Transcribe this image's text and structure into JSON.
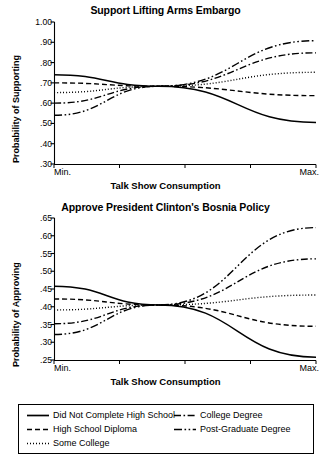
{
  "chart_data": [
    {
      "type": "line",
      "title": "Support Lifting Arms Embargo",
      "xlabel": "Talk Show Consumption",
      "ylabel": "Probability of Supporting",
      "xtick_labels": [
        "Min.",
        "Max."
      ],
      "ytick_labels": [
        "1.00",
        ".90",
        ".80",
        ".70",
        ".60",
        ".50",
        ".40",
        ".30"
      ],
      "ytick_values": [
        1.0,
        0.9,
        0.8,
        0.7,
        0.6,
        0.5,
        0.4,
        0.3
      ],
      "ylim": [
        0.3,
        1.0
      ],
      "xlim": [
        0,
        1
      ],
      "grid": false,
      "legend_position": "below-figure",
      "series": [
        {
          "name": "Did Not Complete High School",
          "style": "solid",
          "x": [
            0,
            0.4,
            1
          ],
          "values": [
            0.74,
            0.683,
            0.505
          ]
        },
        {
          "name": "High School Diploma",
          "style": "dashed",
          "x": [
            0,
            0.4,
            1
          ],
          "values": [
            0.7,
            0.683,
            0.637
          ]
        },
        {
          "name": "Some College",
          "style": "dotted",
          "x": [
            0,
            0.4,
            1
          ],
          "values": [
            0.652,
            0.683,
            0.752
          ]
        },
        {
          "name": "College Degree",
          "style": "dashdot",
          "x": [
            0,
            0.4,
            1
          ],
          "values": [
            0.6,
            0.683,
            0.848
          ]
        },
        {
          "name": "Post-Graduate Degree",
          "style": "dashdotdot",
          "x": [
            0,
            0.4,
            1
          ],
          "values": [
            0.54,
            0.683,
            0.908
          ]
        }
      ]
    },
    {
      "type": "line",
      "title": "Approve President Clinton's Bosnia Policy",
      "xlabel": "Talk Show Consumption",
      "ylabel": "Probability of Approving",
      "xtick_labels": [
        "Min.",
        "Max."
      ],
      "ytick_labels": [
        ".65",
        ".60",
        ".55",
        ".50",
        ".45",
        ".40",
        ".35",
        ".30",
        ".25"
      ],
      "ytick_values": [
        0.65,
        0.6,
        0.55,
        0.5,
        0.45,
        0.4,
        0.35,
        0.3,
        0.25
      ],
      "ylim": [
        0.25,
        0.65
      ],
      "xlim": [
        0,
        1
      ],
      "grid": false,
      "legend_position": "below-figure",
      "series": [
        {
          "name": "Did Not Complete High School",
          "style": "solid",
          "x": [
            0,
            0.4,
            1
          ],
          "values": [
            0.458,
            0.405,
            0.258
          ]
        },
        {
          "name": "High School Diploma",
          "style": "dashed",
          "x": [
            0,
            0.4,
            1
          ],
          "values": [
            0.422,
            0.405,
            0.345
          ]
        },
        {
          "name": "Some College",
          "style": "dotted",
          "x": [
            0,
            0.4,
            1
          ],
          "values": [
            0.391,
            0.405,
            0.433
          ]
        },
        {
          "name": "College Degree",
          "style": "dashdot",
          "x": [
            0,
            0.4,
            1
          ],
          "values": [
            0.352,
            0.405,
            0.535
          ]
        },
        {
          "name": "Post-Graduate Degree",
          "style": "dashdotdot",
          "x": [
            0,
            0.4,
            1
          ],
          "values": [
            0.322,
            0.405,
            0.623
          ]
        }
      ]
    }
  ],
  "legend": {
    "entries": [
      {
        "label": "Did Not Complete High School",
        "style": "solid"
      },
      {
        "label": "High School Diploma",
        "style": "dashed"
      },
      {
        "label": "Some College",
        "style": "dotted"
      },
      {
        "label": "College Degree",
        "style": "dashdot"
      },
      {
        "label": "Post-Graduate Degree",
        "style": "dashdotdot"
      }
    ]
  },
  "style": {
    "line_color": "#000000",
    "axis_color": "#000000",
    "background": "#ffffff"
  }
}
